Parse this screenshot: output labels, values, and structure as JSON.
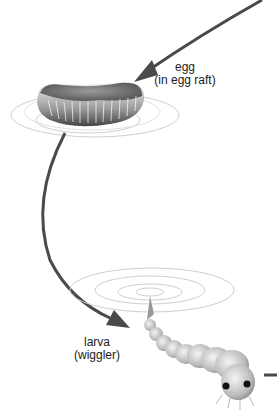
{
  "stages": [
    {
      "name": "egg",
      "detail": "(in egg raft)"
    },
    {
      "name": "larva",
      "detail": "(wiggler)"
    }
  ],
  "colors": {
    "arrow": "#4a4a4a",
    "ripple": "#c8c8c8",
    "text": "#222222"
  }
}
